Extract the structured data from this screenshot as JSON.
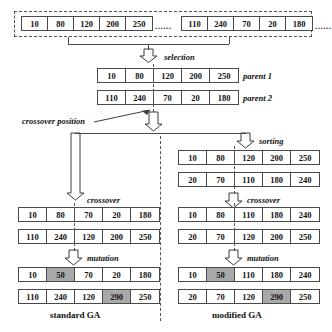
{
  "diagram": {
    "title_left": "standard GA",
    "title_right": "modified GA",
    "ellipsis": "......",
    "labels": {
      "selection": "selection",
      "crossover_position": "crossover position",
      "sorting": "sorting",
      "crossover": "crossover",
      "mutation": "mutation",
      "parent1": "parent 1",
      "parent2": "parent 2"
    }
  },
  "population": {
    "chromosome_a": [
      "10",
      "80",
      "120",
      "200",
      "250"
    ],
    "chromosome_b": [
      "110",
      "240",
      "70",
      "20",
      "180"
    ]
  },
  "parents": {
    "parent1": [
      "10",
      "80",
      "120",
      "200",
      "250"
    ],
    "parent2": [
      "110",
      "240",
      "70",
      "20",
      "180"
    ]
  },
  "standard_ga": {
    "crossover": {
      "row1": [
        "10",
        "80",
        "70",
        "20",
        "180"
      ],
      "row2": [
        "110",
        "240",
        "120",
        "200",
        "250"
      ]
    },
    "mutation": {
      "row1": [
        "10",
        "50",
        "70",
        "20",
        "180"
      ],
      "row2": [
        "110",
        "240",
        "120",
        "290",
        "250"
      ],
      "row1_shaded_index": 1,
      "row2_shaded_index": 3
    }
  },
  "modified_ga": {
    "sorting": {
      "row1": [
        "10",
        "80",
        "120",
        "200",
        "250"
      ],
      "row2": [
        "20",
        "70",
        "110",
        "180",
        "240"
      ]
    },
    "crossover": {
      "row1": [
        "10",
        "80",
        "110",
        "180",
        "240"
      ],
      "row2": [
        "20",
        "70",
        "120",
        "200",
        "250"
      ]
    },
    "mutation": {
      "row1": [
        "10",
        "50",
        "110",
        "180",
        "240"
      ],
      "row2": [
        "20",
        "70",
        "120",
        "290",
        "250"
      ],
      "row1_shaded_index": 1,
      "row2_shaded_index": 3
    }
  },
  "colors": {
    "line": "#4a4a4a",
    "shade": "#a9a9a9",
    "text": "#111111"
  }
}
